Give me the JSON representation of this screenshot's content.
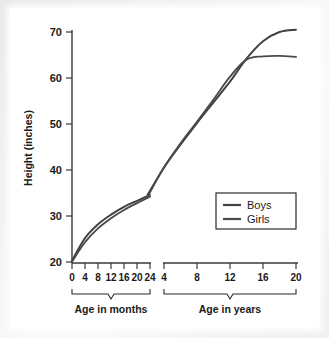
{
  "chart_data": {
    "type": "line",
    "title": "",
    "xlabel": "",
    "ylabel": "Height (inches)",
    "ylim": [
      20,
      70
    ],
    "yticks": [
      20,
      30,
      40,
      50,
      60,
      70
    ],
    "ytick_labels": [
      "20",
      "30",
      "40",
      "50",
      "60",
      "70"
    ],
    "grid": false,
    "legend_position": "inside-lower-right",
    "axis_segments": [
      {
        "name": "months",
        "bracket_label": "Age in months",
        "unit": "months",
        "ticks": [
          0,
          4,
          8,
          12,
          16,
          20,
          24
        ],
        "tick_labels": [
          "0",
          "4",
          "8",
          "12",
          "16",
          "20",
          "24"
        ]
      },
      {
        "name": "years",
        "bracket_label": "Age in years",
        "unit": "years",
        "ticks": [
          4,
          8,
          12,
          16,
          20
        ],
        "tick_labels": [
          "4",
          "8",
          "12",
          "16",
          "20"
        ]
      }
    ],
    "series": [
      {
        "name": "Boys",
        "color": "#404040",
        "months_values": [
          {
            "x": 0,
            "y": 20.3
          },
          {
            "x": 4,
            "y": 25.2
          },
          {
            "x": 8,
            "y": 28.2
          },
          {
            "x": 12,
            "y": 30.3
          },
          {
            "x": 16,
            "y": 32.0
          },
          {
            "x": 20,
            "y": 33.3
          },
          {
            "x": 24,
            "y": 34.6
          }
        ],
        "years_values": [
          {
            "x": 2,
            "y": 34.6
          },
          {
            "x": 4,
            "y": 40.5
          },
          {
            "x": 6,
            "y": 45.5
          },
          {
            "x": 8,
            "y": 50.2
          },
          {
            "x": 10,
            "y": 54.7
          },
          {
            "x": 12,
            "y": 59.2
          },
          {
            "x": 14,
            "y": 64.2
          },
          {
            "x": 16,
            "y": 68.0
          },
          {
            "x": 18,
            "y": 70.0
          },
          {
            "x": 20,
            "y": 70.5
          }
        ]
      },
      {
        "name": "Girls",
        "color": "#4a4a4a",
        "months_values": [
          {
            "x": 0,
            "y": 20.1
          },
          {
            "x": 4,
            "y": 24.3
          },
          {
            "x": 8,
            "y": 27.3
          },
          {
            "x": 12,
            "y": 29.5
          },
          {
            "x": 16,
            "y": 31.3
          },
          {
            "x": 20,
            "y": 32.8
          },
          {
            "x": 24,
            "y": 34.2
          }
        ],
        "years_values": [
          {
            "x": 2,
            "y": 34.2
          },
          {
            "x": 4,
            "y": 40.6
          },
          {
            "x": 6,
            "y": 45.8
          },
          {
            "x": 8,
            "y": 50.5
          },
          {
            "x": 10,
            "y": 55.3
          },
          {
            "x": 12,
            "y": 60.3
          },
          {
            "x": 14,
            "y": 64.0
          },
          {
            "x": 16,
            "y": 64.7
          },
          {
            "x": 18,
            "y": 64.8
          },
          {
            "x": 20,
            "y": 64.6
          }
        ]
      }
    ],
    "annotations": {
      "crossover_note": "Curves cross near age 14 years at about 64 inches"
    }
  },
  "legend": {
    "entries": [
      {
        "label": "Boys",
        "color": "#404040"
      },
      {
        "label": "Girls",
        "color": "#4a4a4a"
      }
    ]
  },
  "axis": {
    "y_title": "Height (inches)",
    "y_labels": [
      "70",
      "60",
      "50",
      "40",
      "30",
      "20"
    ],
    "x_months_labels": [
      "0",
      "4",
      "8",
      "12",
      "16",
      "20",
      "24"
    ],
    "x_years_labels": [
      "4",
      "8",
      "12",
      "16",
      "20"
    ],
    "bracket_months_label": "Age in months",
    "bracket_years_label": "Age in years"
  },
  "colors": {
    "boys": "#404040",
    "girls": "#4a4a4a",
    "axis": "#3a3a3a",
    "text": "#1a1a1a",
    "background": "#ffffff",
    "frame": "#e9e9e9"
  }
}
